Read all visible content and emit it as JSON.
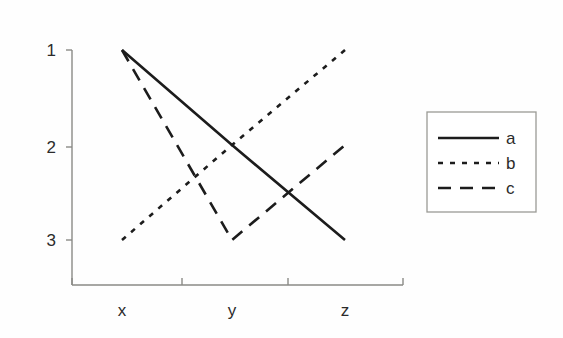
{
  "chart_data": {
    "type": "line",
    "title": "",
    "subtitle": "",
    "xlabel": "",
    "ylabel": "",
    "categories": [
      "x",
      "y",
      "z"
    ],
    "ytick_labels": [
      "1",
      "2",
      "3"
    ],
    "ytick_values": [
      1,
      2,
      3
    ],
    "ylim": [
      1,
      3
    ],
    "y_axis_inverted": true,
    "grid": false,
    "legend_position": "right",
    "series": [
      {
        "name": "a",
        "label": "a",
        "style": "solid",
        "color": "#1c1c1c",
        "values": [
          1,
          2,
          3
        ]
      },
      {
        "name": "b",
        "label": "b",
        "style": "dotted",
        "color": "#1c1c1c",
        "values": [
          3,
          2,
          1
        ]
      },
      {
        "name": "c",
        "label": "c",
        "style": "dashed",
        "color": "#1c1c1c",
        "values": [
          1,
          3,
          2
        ]
      }
    ],
    "annotations": []
  },
  "axes": {
    "y_ticks": [
      {
        "label": "1",
        "value": 1
      },
      {
        "label": "2",
        "value": 2
      },
      {
        "label": "3",
        "value": 3
      }
    ],
    "x_ticks": [
      {
        "label": "x",
        "value": "x"
      },
      {
        "label": "y",
        "value": "y"
      },
      {
        "label": "z",
        "value": "z"
      }
    ]
  },
  "legend": {
    "entries": [
      {
        "label": "a",
        "style": "solid"
      },
      {
        "label": "b",
        "style": "dotted"
      },
      {
        "label": "c",
        "style": "dashed"
      }
    ]
  },
  "colors": {
    "background": "#fefefe",
    "axis": "#8a8a86",
    "line": "#1c1c1c",
    "text": "#2b2b2b",
    "legend_border": "#9a9a95"
  }
}
